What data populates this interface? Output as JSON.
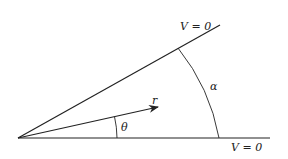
{
  "figure": {
    "upper_boundary_label": "V = 0",
    "lower_boundary_label": "V = 0",
    "radius_label": "r",
    "theta_label": "θ",
    "alpha_label": "α"
  },
  "colors": {
    "line": "#222222",
    "background": "#ffffff"
  }
}
